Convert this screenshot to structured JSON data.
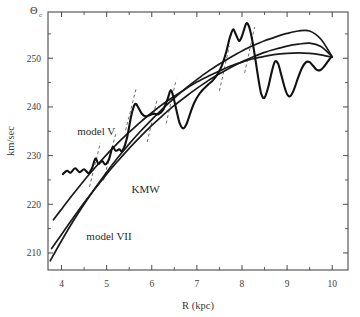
{
  "chart_data": {
    "type": "line",
    "title": "",
    "xlabel": "R (kpc)",
    "ylabel": "km/sec",
    "ylabel_symbol": "Θ",
    "ylabel_symbol_sub": "c",
    "xlim": [
      3.7,
      10.35
    ],
    "ylim": [
      206.5,
      259.5
    ],
    "xticks": [
      4,
      5,
      6,
      7,
      8,
      9,
      10
    ],
    "xtick_labels": [
      "4",
      "5",
      "6",
      "7",
      "8",
      "9",
      "10"
    ],
    "xticks_minor": [
      4.5,
      5.5,
      6.5,
      7.5,
      8.5,
      9.5
    ],
    "yticks": [
      210,
      220,
      230,
      240,
      250
    ],
    "ytick_labels": [
      "210",
      "220",
      "230",
      "240",
      "250"
    ],
    "yticks_minor": [
      215,
      225,
      235,
      245,
      255
    ],
    "grid": false,
    "legend_position": "inline-annotations",
    "series": [
      {
        "name": "model V",
        "style": "solid",
        "label_x": 4.35,
        "label_y": 234.2,
        "points": [
          [
            3.82,
            216.8
          ],
          [
            4.0,
            219.0
          ],
          [
            4.25,
            222.0
          ],
          [
            4.5,
            224.9
          ],
          [
            4.75,
            227.6
          ],
          [
            5.0,
            230.2
          ],
          [
            5.25,
            232.6
          ],
          [
            5.5,
            234.8
          ],
          [
            5.75,
            236.9
          ],
          [
            6.0,
            238.8
          ],
          [
            6.25,
            240.6
          ],
          [
            6.5,
            242.2
          ],
          [
            6.75,
            243.7
          ],
          [
            7.0,
            245.1
          ],
          [
            7.25,
            246.3
          ],
          [
            7.5,
            247.4
          ],
          [
            7.75,
            248.4
          ],
          [
            8.0,
            249.2
          ],
          [
            8.25,
            249.9
          ],
          [
            8.5,
            250.4
          ],
          [
            8.75,
            250.8
          ],
          [
            9.0,
            251.0
          ],
          [
            9.25,
            251.1
          ],
          [
            9.5,
            251.0
          ],
          [
            9.75,
            250.7
          ],
          [
            10.0,
            250.2
          ]
        ]
      },
      {
        "name": "KMW",
        "style": "solid",
        "label_x": 5.55,
        "label_y": 222.3,
        "points": [
          [
            3.78,
            210.9
          ],
          [
            4.0,
            213.8
          ],
          [
            4.25,
            217.1
          ],
          [
            4.5,
            220.3
          ],
          [
            4.75,
            223.3
          ],
          [
            5.0,
            226.2
          ],
          [
            5.25,
            228.9
          ],
          [
            5.5,
            231.5
          ],
          [
            5.75,
            233.9
          ],
          [
            6.0,
            236.2
          ],
          [
            6.25,
            238.3
          ],
          [
            6.5,
            240.3
          ],
          [
            6.75,
            242.1
          ],
          [
            7.0,
            243.8
          ],
          [
            7.25,
            245.4
          ],
          [
            7.5,
            246.8
          ],
          [
            7.75,
            248.1
          ],
          [
            8.0,
            249.3
          ],
          [
            8.25,
            250.3
          ],
          [
            8.5,
            251.2
          ],
          [
            8.75,
            251.9
          ],
          [
            9.0,
            252.5
          ],
          [
            9.25,
            252.9
          ],
          [
            9.5,
            253.1
          ],
          [
            9.75,
            252.4
          ],
          [
            10.0,
            250.3
          ]
        ]
      },
      {
        "name": "model VII",
        "style": "solid",
        "label_x": 4.55,
        "label_y": 212.6,
        "points": [
          [
            3.75,
            208.4
          ],
          [
            4.0,
            212.5
          ],
          [
            4.25,
            216.4
          ],
          [
            4.5,
            220.0
          ],
          [
            4.75,
            223.4
          ],
          [
            5.0,
            226.6
          ],
          [
            5.25,
            229.6
          ],
          [
            5.5,
            232.4
          ],
          [
            5.75,
            235.0
          ],
          [
            6.0,
            237.4
          ],
          [
            6.25,
            239.7
          ],
          [
            6.5,
            241.8
          ],
          [
            6.75,
            243.8
          ],
          [
            7.0,
            245.6
          ],
          [
            7.25,
            247.3
          ],
          [
            7.5,
            248.8
          ],
          [
            7.75,
            250.2
          ],
          [
            8.0,
            251.5
          ],
          [
            8.25,
            252.6
          ],
          [
            8.5,
            253.6
          ],
          [
            8.75,
            254.4
          ],
          [
            9.0,
            255.1
          ],
          [
            9.25,
            255.6
          ],
          [
            9.5,
            255.6
          ],
          [
            9.75,
            253.9
          ],
          [
            10.0,
            250.3
          ]
        ]
      },
      {
        "name": "observed-rotation-curve",
        "style": "wiggly",
        "points": [
          [
            4.03,
            226.2
          ],
          [
            4.12,
            226.9
          ],
          [
            4.2,
            226.5
          ],
          [
            4.3,
            227.4
          ],
          [
            4.4,
            226.6
          ],
          [
            4.5,
            227.2
          ],
          [
            4.6,
            226.4
          ],
          [
            4.68,
            227.5
          ],
          [
            4.75,
            229.4
          ],
          [
            4.82,
            228.3
          ],
          [
            4.9,
            228.9
          ],
          [
            4.97,
            228.2
          ],
          [
            5.05,
            229.2
          ],
          [
            5.13,
            231.7
          ],
          [
            5.2,
            231.0
          ],
          [
            5.28,
            231.3
          ],
          [
            5.35,
            231.0
          ],
          [
            5.45,
            233.6
          ],
          [
            5.55,
            238.4
          ],
          [
            5.63,
            240.6
          ],
          [
            5.7,
            239.9
          ],
          [
            5.78,
            238.6
          ],
          [
            5.86,
            238.1
          ],
          [
            5.95,
            238.3
          ],
          [
            6.05,
            238.6
          ],
          [
            6.15,
            238.5
          ],
          [
            6.25,
            239.4
          ],
          [
            6.35,
            241.6
          ],
          [
            6.42,
            243.4
          ],
          [
            6.48,
            242.0
          ],
          [
            6.55,
            239.2
          ],
          [
            6.62,
            236.6
          ],
          [
            6.7,
            235.6
          ],
          [
            6.78,
            236.7
          ],
          [
            6.86,
            238.9
          ],
          [
            6.95,
            241.0
          ],
          [
            7.05,
            242.6
          ],
          [
            7.15,
            243.7
          ],
          [
            7.25,
            244.6
          ],
          [
            7.35,
            245.4
          ],
          [
            7.45,
            246.6
          ],
          [
            7.55,
            248.4
          ],
          [
            7.65,
            251.3
          ],
          [
            7.73,
            254.2
          ],
          [
            7.8,
            255.9
          ],
          [
            7.86,
            255.0
          ],
          [
            7.93,
            253.6
          ],
          [
            7.99,
            254.3
          ],
          [
            8.05,
            256.0
          ],
          [
            8.1,
            257.2
          ],
          [
            8.16,
            256.4
          ],
          [
            8.23,
            253.6
          ],
          [
            8.3,
            249.6
          ],
          [
            8.37,
            245.4
          ],
          [
            8.43,
            242.6
          ],
          [
            8.5,
            241.9
          ],
          [
            8.58,
            244.0
          ],
          [
            8.66,
            247.2
          ],
          [
            8.73,
            249.3
          ],
          [
            8.8,
            248.9
          ],
          [
            8.87,
            246.6
          ],
          [
            8.94,
            244.2
          ],
          [
            9.0,
            242.6
          ],
          [
            9.07,
            242.2
          ],
          [
            9.15,
            243.5
          ],
          [
            9.24,
            245.9
          ],
          [
            9.33,
            248.0
          ],
          [
            9.42,
            249.2
          ],
          [
            9.5,
            249.2
          ],
          [
            9.58,
            248.4
          ],
          [
            9.66,
            247.6
          ],
          [
            9.74,
            247.6
          ],
          [
            9.82,
            248.3
          ],
          [
            9.9,
            249.3
          ],
          [
            9.97,
            250.2
          ]
        ]
      }
    ],
    "tangent_segments": [
      {
        "x1": 4.62,
        "y1": 223.6,
        "x2": 4.86,
        "y2": 232.6
      },
      {
        "x1": 4.93,
        "y1": 224.9,
        "x2": 5.2,
        "y2": 234.4
      },
      {
        "x1": 5.42,
        "y1": 235.2,
        "x2": 5.66,
        "y2": 244.0
      },
      {
        "x1": 5.9,
        "y1": 232.8,
        "x2": 6.12,
        "y2": 241.6
      },
      {
        "x1": 6.32,
        "y1": 236.6,
        "x2": 6.54,
        "y2": 245.6
      },
      {
        "x1": 7.5,
        "y1": 243.3,
        "x2": 7.72,
        "y2": 252.5
      },
      {
        "x1": 8.06,
        "y1": 247.0,
        "x2": 8.28,
        "y2": 256.4
      }
    ]
  }
}
